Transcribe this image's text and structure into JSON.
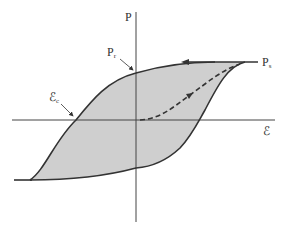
{
  "diagram": {
    "type": "ferroelectric-hysteresis-loop",
    "axes": {
      "y_label": "P",
      "x_label": "ℰ"
    },
    "labels": {
      "remanent_polarization": {
        "main": "P",
        "sub": "r"
      },
      "saturation_polarization": {
        "main": "P",
        "sub": "s"
      },
      "coercive_field": {
        "main": "ℰ",
        "sub": "c"
      }
    },
    "colors": {
      "loop_fill": "#cfcfcf",
      "curve": "#333333",
      "axis": "#444444"
    }
  }
}
